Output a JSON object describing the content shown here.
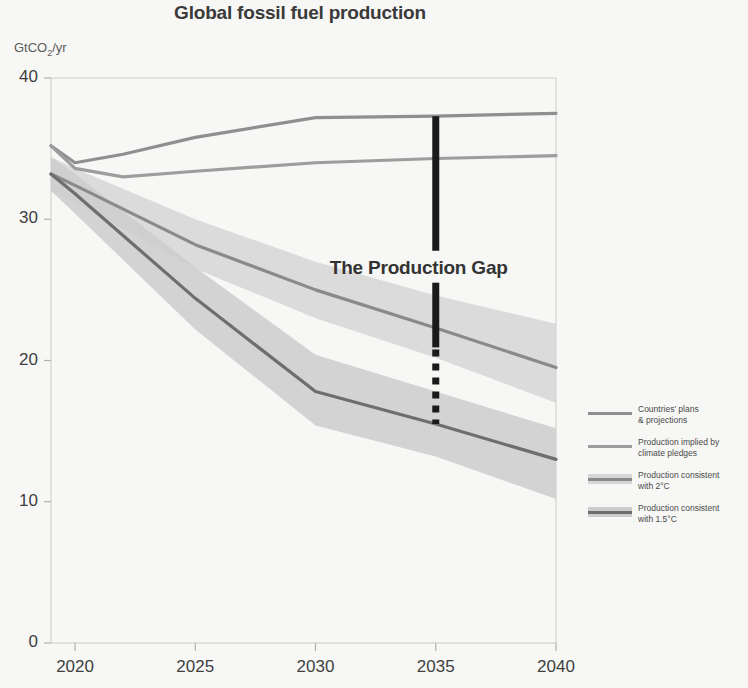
{
  "chart_data": {
    "type": "line",
    "title": "Global fossil fuel production",
    "ylabel": "GtCO2/yr",
    "ylabel_html": "GtCO<sub>2</sub>/yr",
    "xlabel": "",
    "xlim": [
      2019,
      2040
    ],
    "ylim": [
      0,
      40
    ],
    "x_ticks": [
      "2020",
      "2025",
      "2030",
      "2035",
      "2040"
    ],
    "x_tick_values": [
      2020,
      2025,
      2030,
      2035,
      2040
    ],
    "y_ticks": [
      "0",
      "10",
      "20",
      "30",
      "40"
    ],
    "y_tick_values": [
      0,
      10,
      20,
      30,
      40
    ],
    "grid": false,
    "legend_position": "right",
    "annotations": [
      {
        "text": "The Production Gap",
        "x": 2035,
        "y": 26.5,
        "marker": "vertical-bar-solid-and-dashed",
        "bar_top_value": 37.3,
        "bar_bottom_value": 15.5
      }
    ],
    "series": [
      {
        "name": "Countries' plans & projections",
        "color": "#8f8f8f",
        "x": [
          2019,
          2020,
          2022,
          2025,
          2030,
          2035,
          2040
        ],
        "values": [
          35.2,
          34.0,
          34.6,
          35.8,
          37.2,
          37.3,
          37.5
        ],
        "band": null
      },
      {
        "name": "Production implied by climate pledges",
        "color": "#9d9d9d",
        "x": [
          2019,
          2020,
          2022,
          2025,
          2030,
          2035,
          2040
        ],
        "values": [
          35.2,
          33.6,
          33.0,
          33.4,
          34.0,
          34.3,
          34.5
        ],
        "band": null
      },
      {
        "name": "Production consistent with 2°C",
        "color": "#8a8a8a",
        "x": [
          2019,
          2020,
          2025,
          2030,
          2035,
          2040
        ],
        "values": [
          33.2,
          32.4,
          28.2,
          25.0,
          22.3,
          19.5
        ],
        "band": {
          "upper": [
            34.4,
            33.6,
            30.0,
            27.0,
            24.6,
            22.6
          ],
          "lower": [
            32.0,
            31.2,
            26.5,
            23.0,
            20.2,
            17.0
          ],
          "color": "#d6d6d6"
        }
      },
      {
        "name": "Production consistent with 1.5°C",
        "color": "#6e6e6e",
        "x": [
          2019,
          2020,
          2025,
          2030,
          2035,
          2040
        ],
        "values": [
          33.2,
          31.8,
          24.4,
          17.8,
          15.5,
          13.0
        ],
        "band": {
          "upper": [
            34.4,
            33.2,
            26.6,
            20.4,
            17.8,
            15.2
          ],
          "lower": [
            32.0,
            30.4,
            22.2,
            15.4,
            13.2,
            10.2
          ],
          "color": "#cccccc"
        }
      }
    ],
    "legend_entries": [
      {
        "label_line1": "Countries' plans",
        "label_line2": "& projections"
      },
      {
        "label_line1": "Production implied by",
        "label_line2": "climate pledges"
      },
      {
        "label_line1": "Production consistent",
        "label_line2": "with 2°C"
      },
      {
        "label_line1": "Production consistent",
        "label_line2": "with 1.5°C"
      }
    ]
  },
  "colors": {
    "background": "#f7f7f5",
    "axis": "#b9b9b9",
    "text": "#3b3b3b",
    "annotation_bar": "#1a1a1a"
  }
}
